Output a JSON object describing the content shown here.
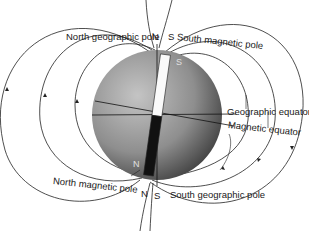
{
  "labels": {
    "north_geographic_pole": "North geographic pole",
    "south_magnetic_pole": "South magnetic pole",
    "geographic_equator": "Geographic equator",
    "magnetic_equator": "Magnetic equator",
    "north_magnetic_pole": "North magnetic pole",
    "south_geographic_pole": "South geographic pole"
  },
  "pole_letters": {
    "top_n": "N",
    "top_s": "S",
    "bottom_n": "N",
    "bottom_s": "S"
  },
  "magnet": {
    "top_pole": "S",
    "bottom_pole": "N"
  },
  "colors": {
    "sphere_light": "#b8b8b8",
    "sphere_dark": "#3a3a3a",
    "magnet_top": "#ffffff",
    "magnet_bottom": "#111111",
    "field_lines": "#222222"
  }
}
